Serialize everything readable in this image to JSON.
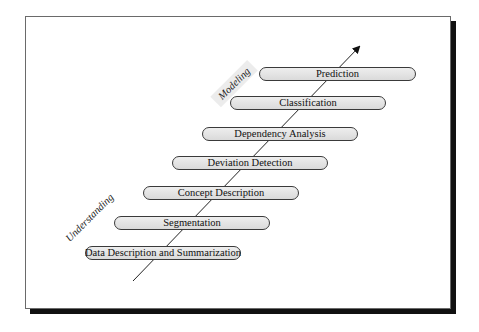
{
  "diagram": {
    "phases": {
      "understanding": "Understanding",
      "modeling": "Modeling"
    },
    "steps": [
      "Data Description and Summarization",
      "Segmentation",
      "Concept Description",
      "Deviation Detection",
      "Dependency Analysis",
      "Classification",
      "Prediction"
    ],
    "colors": {
      "pill_fill": "#e4e4e4",
      "pill_border": "#3a3a3a",
      "shadow": "#111111"
    }
  }
}
